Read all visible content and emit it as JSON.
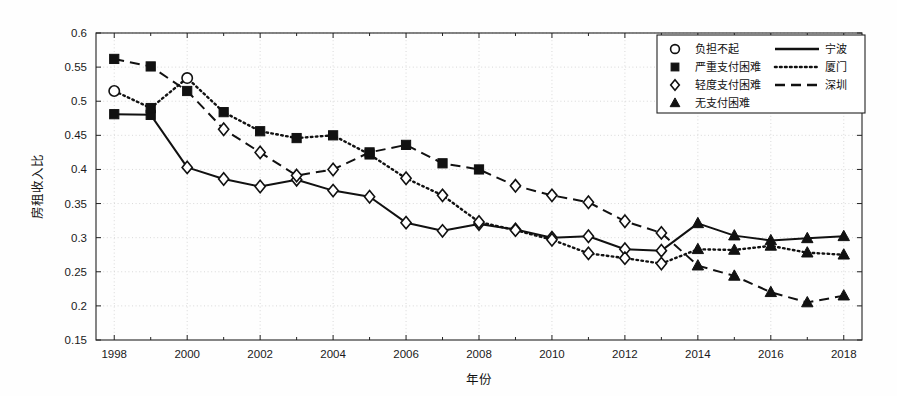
{
  "chart_data": {
    "type": "line",
    "title": "",
    "xlabel": "年份",
    "ylabel": "房租收入比",
    "xlim": [
      1997.5,
      2018.5
    ],
    "ylim": [
      0.15,
      0.6
    ],
    "ytick_step": 0.05,
    "grid": true,
    "legend_position": "top-right",
    "x": [
      1998,
      1999,
      2000,
      2001,
      2002,
      2003,
      2004,
      2005,
      2006,
      2007,
      2008,
      2009,
      2010,
      2011,
      2012,
      2013,
      2014,
      2015,
      2016,
      2017,
      2018
    ],
    "xticks": [
      1998,
      2000,
      2002,
      2004,
      2006,
      2008,
      2010,
      2012,
      2014,
      2016,
      2018
    ],
    "xticklabels": [
      "1998",
      "2000",
      "2002",
      "2004",
      "2006",
      "2008",
      "2010",
      "2012",
      "2014",
      "2016",
      "2018"
    ],
    "yticks": [
      0.15,
      0.2,
      0.25,
      0.3,
      0.35,
      0.4,
      0.45,
      0.5,
      0.55,
      0.6
    ],
    "yticklabels": [
      "0.15",
      "0.2",
      "0.25",
      "0.3",
      "0.35",
      "0.4",
      "0.45",
      "0.5",
      "0.55",
      "0.6"
    ],
    "marker_legend": [
      {
        "marker": "circle-open",
        "label": "负担不起"
      },
      {
        "marker": "square-filled",
        "label": "严重支付困难"
      },
      {
        "marker": "diamond-open",
        "label": "轻度支付困难"
      },
      {
        "marker": "triangle-filled",
        "label": "无支付困难"
      }
    ],
    "line_legend": [
      {
        "style": "solid",
        "label": "宁波"
      },
      {
        "style": "dotted",
        "label": "厦门"
      },
      {
        "style": "dashed",
        "label": "深圳"
      }
    ],
    "series": [
      {
        "name": "宁波",
        "style": "solid",
        "values": [
          0.481,
          0.48,
          0.403,
          0.386,
          0.375,
          0.385,
          0.369,
          0.36,
          0.322,
          0.31,
          0.32,
          0.312,
          0.3,
          0.302,
          0.283,
          0.281,
          0.321,
          0.303,
          0.296,
          0.299,
          0.302
        ],
        "markers": [
          "square-filled",
          "square-filled",
          "diamond-open",
          "diamond-open",
          "diamond-open",
          "diamond-open",
          "diamond-open",
          "diamond-open",
          "diamond-open",
          "diamond-open",
          "diamond-open",
          "diamond-open",
          "diamond-open",
          "diamond-open",
          "diamond-open",
          "diamond-open",
          "triangle-filled",
          "triangle-filled",
          "triangle-filled",
          "triangle-filled",
          "triangle-filled"
        ]
      },
      {
        "name": "厦门",
        "style": "dotted",
        "values": [
          0.515,
          0.49,
          0.534,
          0.484,
          0.456,
          0.446,
          0.45,
          0.422,
          0.387,
          0.362,
          0.323,
          0.311,
          0.297,
          0.277,
          0.27,
          0.262,
          0.283,
          0.282,
          0.288,
          0.278,
          0.275
        ],
        "markers": [
          "circle-open",
          "square-filled",
          "circle-open",
          "square-filled",
          "square-filled",
          "square-filled",
          "square-filled",
          "square-filled",
          "diamond-open",
          "diamond-open",
          "diamond-open",
          "diamond-open",
          "diamond-open",
          "diamond-open",
          "diamond-open",
          "diamond-open",
          "triangle-filled",
          "triangle-filled",
          "triangle-filled",
          "triangle-filled",
          "triangle-filled"
        ]
      },
      {
        "name": "深圳",
        "style": "dashed",
        "values": [
          0.562,
          0.551,
          0.515,
          0.459,
          0.425,
          0.391,
          0.4,
          0.425,
          0.436,
          0.409,
          0.4,
          0.376,
          0.362,
          0.352,
          0.324,
          0.307,
          0.259,
          0.244,
          0.22,
          0.205,
          0.215
        ],
        "markers": [
          "square-filled",
          "square-filled",
          "square-filled",
          "diamond-open",
          "diamond-open",
          "diamond-open",
          "diamond-open",
          "square-filled",
          "square-filled",
          "square-filled",
          "square-filled",
          "diamond-open",
          "diamond-open",
          "diamond-open",
          "diamond-open",
          "diamond-open",
          "triangle-filled",
          "triangle-filled",
          "triangle-filled",
          "triangle-filled",
          "triangle-filled"
        ]
      }
    ]
  },
  "colors": {
    "line": "#111111",
    "grid": "#cfcfcf",
    "axis": "#222222",
    "background": "#ffffff"
  }
}
